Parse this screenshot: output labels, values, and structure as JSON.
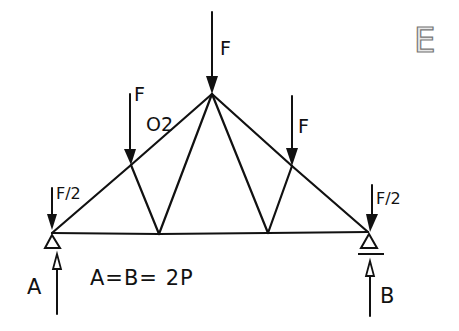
{
  "figure": {
    "panel_label": "E"
  },
  "nodes": {
    "A": {
      "x": 52,
      "y": 233
    },
    "B": {
      "x": 368,
      "y": 232
    },
    "apex": {
      "x": 212,
      "y": 94
    },
    "upper_left": {
      "x": 131,
      "y": 165
    },
    "upper_right": {
      "x": 292,
      "y": 166
    },
    "lower_left": {
      "x": 159,
      "y": 234
    },
    "lower_right": {
      "x": 268,
      "y": 233
    }
  },
  "loads": [
    {
      "label": "F",
      "node": "apex",
      "label_x": 222,
      "label_y": 52
    },
    {
      "label": "F",
      "node": "upper_left",
      "label_x": 137,
      "label_y": 103
    },
    {
      "label": "F",
      "node": "upper_right",
      "label_x": 300,
      "label_y": 133
    },
    {
      "label": "F/2",
      "node": "A",
      "label_x": 58,
      "label_y": 182
    },
    {
      "label": "F/2",
      "node": "B",
      "label_x": 378,
      "label_y": 192
    }
  ],
  "member_labels": [
    {
      "label": "O2",
      "x": 148,
      "y": 124
    }
  ],
  "reactions": [
    {
      "label": "A",
      "x": 28,
      "y": 289
    },
    {
      "label": "B",
      "x": 380,
      "y": 301
    }
  ],
  "equation": {
    "text": "A=B= 2P",
    "x": 90,
    "y": 283
  }
}
